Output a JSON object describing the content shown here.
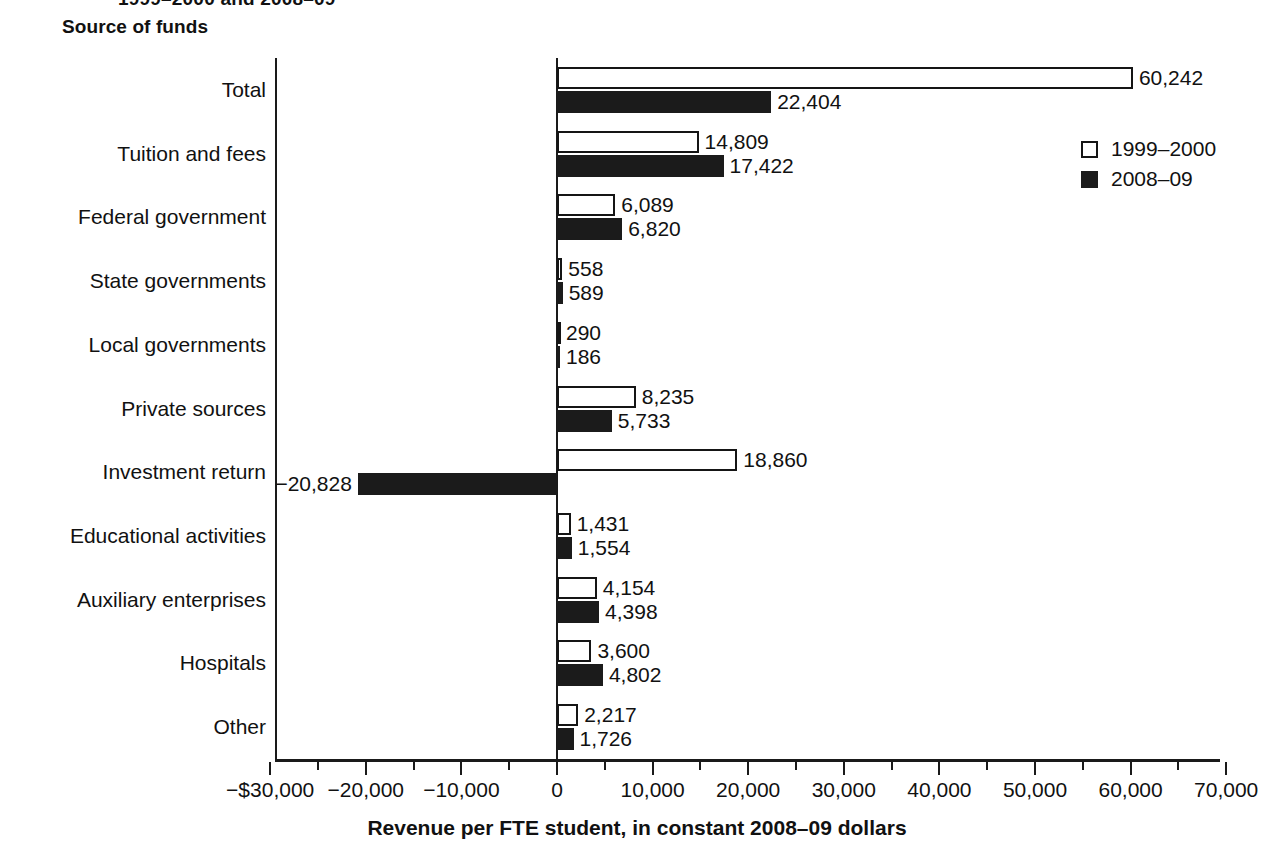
{
  "figure": {
    "clipped_header": "1999–2000 and 2008–09",
    "section_title": "Source of funds",
    "axis_title": "Revenue per FTE student, in constant 2008–09 dollars"
  },
  "legend": {
    "position": "top-right",
    "items": [
      {
        "label": "1999–2000",
        "swatch": "hollow-square",
        "color": "#ffffff"
      },
      {
        "label": "2008–09",
        "swatch": "filled-square",
        "color": "#1b1b1b"
      }
    ]
  },
  "chart_data": {
    "type": "bar",
    "orientation": "horizontal",
    "title": "Source of funds",
    "xlabel": "Revenue per FTE student, in constant 2008–09 dollars",
    "ylabel": "Source of funds",
    "xlim": [
      -30000,
      70000
    ],
    "xticks": [
      -30000,
      -20000,
      -10000,
      0,
      10000,
      20000,
      30000,
      40000,
      50000,
      60000,
      70000
    ],
    "xticklabels": [
      "−$30,000",
      "−20,000",
      "−10,000",
      "0",
      "10,000",
      "20,000",
      "30,000",
      "40,000",
      "50,000",
      "60,000",
      "70,000"
    ],
    "minor_ticks": [
      -25000,
      -15000,
      -5000,
      5000,
      15000,
      25000,
      35000,
      45000,
      55000,
      65000
    ],
    "grid": false,
    "legend_position": "upper right",
    "categories": [
      "Total",
      "Tuition and fees",
      "Federal government",
      "State governments",
      "Local governments",
      "Private sources",
      "Investment return",
      "Educational activities",
      "Auxiliary enterprises",
      "Hospitals",
      "Other"
    ],
    "series": [
      {
        "name": "1999–2000",
        "values": [
          60242,
          14809,
          6089,
          558,
          290,
          8235,
          18860,
          1431,
          4154,
          3600,
          2217
        ],
        "labels": [
          "60,242",
          "14,809",
          "6,089",
          "558",
          "290",
          "8,235",
          "18,860",
          "1,431",
          "4,154",
          "3,600",
          "2,217"
        ]
      },
      {
        "name": "2008–09",
        "values": [
          22404,
          17422,
          6820,
          589,
          186,
          5733,
          -20828,
          1554,
          4398,
          4802,
          1726
        ],
        "labels": [
          "22,404",
          "17,422",
          "6,820",
          "589",
          "186",
          "5,733",
          "−20,828",
          "1,554",
          "4,398",
          "4,802",
          "1,726"
        ]
      }
    ]
  }
}
